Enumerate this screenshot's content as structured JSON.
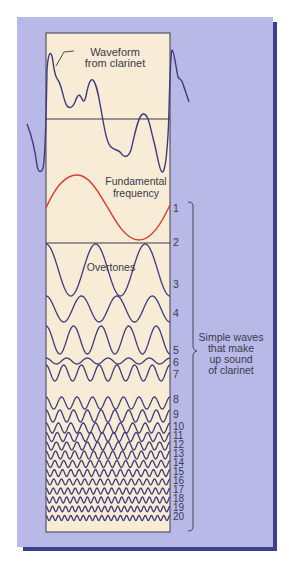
{
  "diagram": {
    "labels": {
      "waveform": [
        "Waveform",
        "from clarinet"
      ],
      "fundamental": [
        "Fundamental",
        "frequency"
      ],
      "overtones": "Overtones",
      "bracket_caption": [
        "Simple waves",
        "that make",
        "up sound",
        "of clarinet"
      ]
    },
    "harmonic_numbers": [
      "1",
      "2",
      "3",
      "4",
      "5",
      "6",
      "7",
      "8",
      "9",
      "10",
      "11",
      "12",
      "13",
      "14",
      "15",
      "16",
      "17",
      "18",
      "19",
      "20"
    ],
    "colors": {
      "panel": "#b9b9e8",
      "panel_shadow": "#3a3f8f",
      "box_fill": "#f8ecd6",
      "wave_line": "#3c3c7e",
      "fundamental_line": "#e03a2e",
      "text": "#3a3a4a"
    }
  }
}
